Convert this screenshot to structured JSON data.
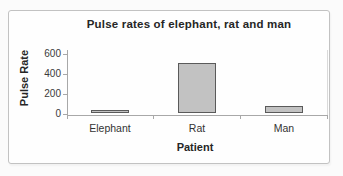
{
  "chart_data": {
    "type": "bar",
    "title": "Pulse rates of elephant, rat and man",
    "categories": [
      "Elephant",
      "Rat",
      "Man"
    ],
    "values": [
      30,
      500,
      70
    ],
    "xlabel": "Patient",
    "ylabel": "Pulse Rate",
    "ylim": [
      0,
      600
    ],
    "yticks": [
      "600",
      "400",
      "200",
      "0"
    ],
    "grid": false,
    "legend": false,
    "bar_fill": "#c2c2c2",
    "bar_border": "#5a5a5a",
    "axis_color": "#a8a8a8"
  }
}
